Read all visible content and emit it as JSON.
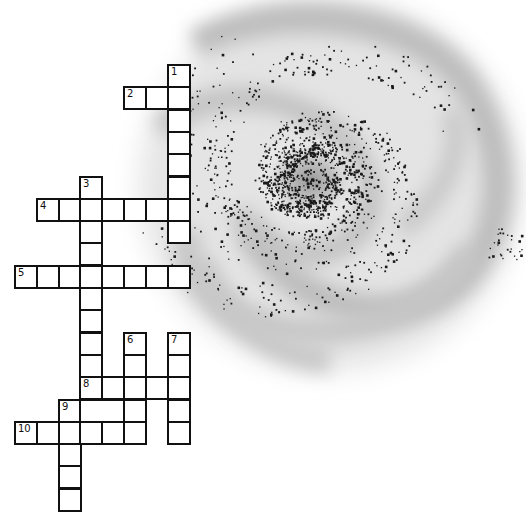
{
  "puzzle": {
    "type": "crossword",
    "theme": "galaxy",
    "grid": {
      "origin_x": 14,
      "origin_y": 64,
      "col_pitch": 21.8,
      "row_pitch": 22.3,
      "border_color": "#111111",
      "cell_fill": "#ffffff"
    },
    "entries": [
      {
        "number": "1",
        "direction": "down",
        "col": 7,
        "row": 0,
        "length": 8
      },
      {
        "number": "2",
        "direction": "across",
        "col": 5,
        "row": 1,
        "length": 3
      },
      {
        "number": "3",
        "direction": "down",
        "col": 3,
        "row": 5,
        "length": 10
      },
      {
        "number": "4",
        "direction": "across",
        "col": 1,
        "row": 6,
        "length": 7
      },
      {
        "number": "5",
        "direction": "across",
        "col": 0,
        "row": 9,
        "length": 8
      },
      {
        "number": "6",
        "direction": "down",
        "col": 5,
        "row": 12,
        "length": 5
      },
      {
        "number": "7",
        "direction": "down",
        "col": 7,
        "row": 12,
        "length": 5
      },
      {
        "number": "8",
        "direction": "across",
        "col": 3,
        "row": 14,
        "length": 5
      },
      {
        "number": "9",
        "direction": "down",
        "col": 2,
        "row": 15,
        "length": 5
      },
      {
        "number": "10",
        "direction": "across",
        "col": 0,
        "row": 16,
        "length": 6
      }
    ],
    "extra_cells": [
      {
        "col": 3,
        "row": 15,
        "span": 2,
        "note": "merged cell (missing divider)"
      },
      {
        "col": 5,
        "row": 15,
        "span": 1
      }
    ]
  },
  "illustration": {
    "name": "spiral-galaxy",
    "center": [
      310,
      180
    ],
    "haze_color": "#bdbdbd",
    "star_color": "#1a1a1a",
    "background": "#ffffff"
  }
}
